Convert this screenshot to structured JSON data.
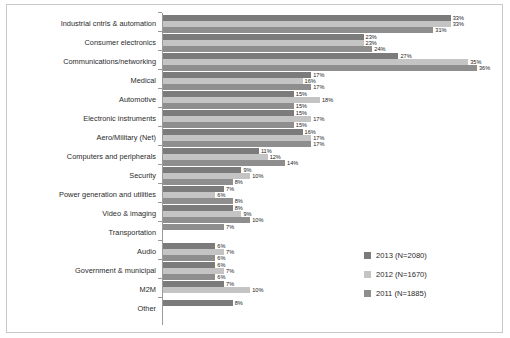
{
  "chart_data": {
    "type": "bar",
    "orientation": "horizontal",
    "title": "",
    "xlabel": "",
    "ylabel": "",
    "grid": false,
    "xlim": [
      0,
      40
    ],
    "legend_position": "inside-bottom-right",
    "categories": [
      "Industrial cntrls & automation",
      "Consumer electronics",
      "Communications/networking",
      "Medical",
      "Automotive",
      "Electronic instruments",
      "Aero/Military (Net)",
      "Computers and peripherals",
      "Security",
      "Power generation and utilities",
      "Video & imaging",
      "Transportation",
      "Audio",
      "Government & municipal",
      "M2M",
      "Other"
    ],
    "series": [
      {
        "name": "2013 (N=2080)",
        "color": "#7b7b7b",
        "values": [
          33,
          23,
          27,
          17,
          15,
          15,
          16,
          11,
          9,
          7,
          8,
          null,
          6,
          6,
          7,
          8
        ],
        "labels": [
          "33%",
          "23%",
          "27%",
          "17%",
          "15%",
          "15%",
          "16%",
          "11%",
          "9%",
          "7%",
          "8%",
          "",
          "6%",
          "6%",
          "7%",
          "8%"
        ]
      },
      {
        "name": "2012 (N=1670)",
        "color": "#c4c4c4",
        "values": [
          33,
          23,
          35,
          16,
          18,
          17,
          17,
          12,
          10,
          6,
          9,
          null,
          7,
          7,
          10,
          null
        ],
        "labels": [
          "33%",
          "23%",
          "35%",
          "16%",
          "18%",
          "17%",
          "17%",
          "12%",
          "10%",
          "6%",
          "9%",
          "",
          "7%",
          "7%",
          "10%",
          ""
        ]
      },
      {
        "name": "2011 (N=1885)",
        "color": "#8e8e8e",
        "values": [
          31,
          24,
          36,
          17,
          15,
          15,
          17,
          14,
          8,
          8,
          10,
          7,
          6,
          6,
          null,
          null
        ],
        "labels": [
          "31%",
          "24%",
          "36%",
          "17%",
          "15%",
          "15%",
          "17%",
          "14%",
          "8%",
          "8%",
          "10%",
          "7%",
          "6%",
          "6%",
          "",
          ""
        ]
      }
    ]
  },
  "legend": {
    "items": [
      {
        "label": "2013 (N=2080)",
        "color": "#7b7b7b"
      },
      {
        "label": "2012 (N=1670)",
        "color": "#c4c4c4"
      },
      {
        "label": "2011 (N=1885)",
        "color": "#8e8e8e"
      }
    ]
  }
}
